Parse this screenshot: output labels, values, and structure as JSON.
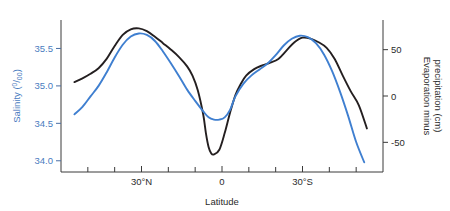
{
  "chart_data": {
    "type": "line",
    "title": "",
    "xlabel": "Latitude",
    "ylabel": "Salinity (0/00)",
    "y2label": "Evaporation minus precipitation (cm)",
    "grid": false,
    "legend": "none",
    "xlim": [
      60,
      -60
    ],
    "x_tick_labels": [
      "30°N",
      "0",
      "30°S"
    ],
    "x_tick_values": [
      30,
      0,
      -30
    ],
    "x_minor_tick_values": [
      50,
      40,
      20,
      10,
      -10,
      -20,
      -40,
      -50
    ],
    "ylim": [
      33.85,
      35.88
    ],
    "y_tick_labels": [
      "34.0",
      "34.5",
      "35.0",
      "35.5"
    ],
    "y_tick_values": [
      34.0,
      34.5,
      35.0,
      35.5
    ],
    "y2lim": [
      -82,
      82
    ],
    "y2_tick_labels": [
      "-50",
      "0",
      "50"
    ],
    "y2_tick_values": [
      -50,
      0,
      50
    ],
    "series": [
      {
        "name": "Salinity",
        "axis": "left",
        "color": "#3f7fd0",
        "unit": "0/00",
        "x": [
          55,
          52,
          49,
          46,
          43,
          40,
          37,
          34,
          31,
          28,
          25,
          22,
          19,
          16,
          13,
          10,
          7,
          5,
          3,
          1,
          -1,
          -3,
          -5,
          -8,
          -11,
          -14,
          -17,
          -20,
          -23,
          -26,
          -29,
          -32,
          -35,
          -38,
          -41,
          -44,
          -47,
          -50,
          -53
        ],
        "y": [
          34.62,
          34.72,
          34.86,
          35.0,
          35.18,
          35.38,
          35.55,
          35.66,
          35.7,
          35.68,
          35.6,
          35.46,
          35.3,
          35.13,
          34.95,
          34.8,
          34.66,
          34.58,
          34.55,
          34.55,
          34.58,
          34.68,
          34.86,
          35.03,
          35.14,
          35.22,
          35.3,
          35.41,
          35.54,
          35.63,
          35.67,
          35.65,
          35.57,
          35.42,
          35.2,
          34.92,
          34.6,
          34.25,
          33.98
        ]
      },
      {
        "name": "Evaporation minus precipitation",
        "axis": "right",
        "color": "#241f20",
        "unit": "cm",
        "x": [
          55,
          52,
          49,
          46,
          43,
          40,
          37,
          34,
          31,
          28,
          25,
          22,
          19,
          16,
          13,
          11,
          9,
          7,
          6,
          5,
          4,
          3,
          1,
          -1,
          -3,
          -5,
          -7,
          -9,
          -12,
          -15,
          -18,
          -21,
          -24,
          -27,
          -30,
          -33,
          -36,
          -39,
          -42,
          -45,
          -48,
          -51,
          -54
        ],
        "y2": [
          15,
          19,
          24,
          30,
          40,
          54,
          66,
          72,
          73,
          70,
          64,
          57,
          50,
          42,
          32,
          22,
          6,
          -20,
          -40,
          -55,
          -62,
          -63,
          -58,
          -40,
          -18,
          1,
          13,
          22,
          29,
          33,
          36,
          40,
          49,
          58,
          63,
          62,
          58,
          52,
          40,
          22,
          5,
          -10,
          -35
        ]
      }
    ],
    "annotations": []
  }
}
